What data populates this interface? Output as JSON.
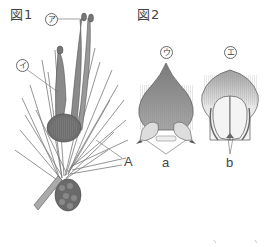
{
  "figure1": {
    "title": "図1",
    "labels": {
      "a": "ア",
      "i": "イ",
      "A": "A"
    }
  },
  "figure2": {
    "title": "図2",
    "labels": {
      "u": "ウ",
      "e": "エ",
      "a": "a",
      "b": "b"
    }
  },
  "colors": {
    "line": "#666666",
    "shade_dark": "#6e6e6e",
    "shade_mid": "#9a9a9a",
    "shade_light": "#d8d8d8"
  }
}
